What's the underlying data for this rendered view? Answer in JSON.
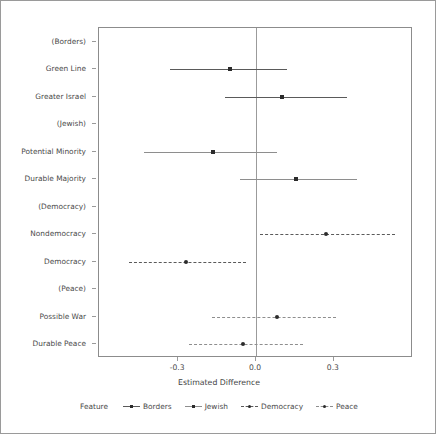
{
  "chart_data": {
    "type": "scatter",
    "title": "",
    "xlabel": "Estimated Difference",
    "ylabel": "",
    "xlim": [
      -0.605,
      0.605
    ],
    "xticks": [
      -0.3,
      0.0,
      0.3
    ],
    "xticklabels": [
      "-0.3",
      "0.0",
      "0.3"
    ],
    "grid": false,
    "zero_reference_line": 0.0,
    "legend_position": "bottom",
    "legend_title": "Feature",
    "categories": [
      "(Borders)",
      "Green Line",
      "Greater Israel",
      "(Jewish)",
      "Potential Minority",
      "Durable Majority",
      "(Democracy)",
      "Nondemocracy",
      "Democracy",
      "(Peace)",
      "Possible War",
      "Durable Peace"
    ],
    "series": [
      {
        "name": "Borders",
        "linestyle": "solid",
        "color": "#5a5a5a",
        "marker": "square",
        "points": [
          {
            "category": "(Borders)",
            "value": null,
            "low": null,
            "high": null,
            "reference": true
          },
          {
            "category": "Green Line",
            "value": -0.1,
            "low": -0.33,
            "high": 0.12
          },
          {
            "category": "Greater Israel",
            "value": 0.1,
            "low": -0.12,
            "high": 0.35
          }
        ]
      },
      {
        "name": "Jewish",
        "linestyle": "solid",
        "color": "#8e8e8e",
        "marker": "square",
        "points": [
          {
            "category": "(Jewish)",
            "value": null,
            "low": null,
            "high": null,
            "reference": true
          },
          {
            "category": "Potential Minority",
            "value": -0.165,
            "low": -0.43,
            "high": 0.08
          },
          {
            "category": "Durable Majority",
            "value": 0.155,
            "low": -0.06,
            "high": 0.39
          }
        ]
      },
      {
        "name": "Democracy",
        "linestyle": "dashed",
        "color": "#5a5a5a",
        "marker": "circle",
        "points": [
          {
            "category": "(Democracy)",
            "value": null,
            "low": null,
            "high": null,
            "reference": true
          },
          {
            "category": "Nondemocracy",
            "value": 0.27,
            "low": 0.015,
            "high": 0.535
          },
          {
            "category": "Democracy",
            "value": -0.27,
            "low": -0.49,
            "high": -0.04
          }
        ]
      },
      {
        "name": "Peace",
        "linestyle": "dashed",
        "color": "#8e8e8e",
        "marker": "circle",
        "points": [
          {
            "category": "(Peace)",
            "value": null,
            "low": null,
            "high": null,
            "reference": true
          },
          {
            "category": "Possible War",
            "value": 0.08,
            "low": -0.17,
            "high": 0.31
          },
          {
            "category": "Durable Peace",
            "value": -0.05,
            "low": -0.26,
            "high": 0.18
          }
        ]
      }
    ]
  },
  "axes": {
    "x_title": "Estimated Difference",
    "x_ticklabels": [
      "-0.3",
      "0.0",
      "0.3"
    ]
  },
  "legend": {
    "title": "Feature",
    "items": [
      "Borders",
      "Jewish",
      "Democracy",
      "Peace"
    ]
  },
  "ylabels": [
    "(Borders)",
    "Green Line",
    "Greater Israel",
    "(Jewish)",
    "Potential Minority",
    "Durable Majority",
    "(Democracy)",
    "Nondemocracy",
    "Democracy",
    "(Peace)",
    "Possible War",
    "Durable Peace"
  ]
}
